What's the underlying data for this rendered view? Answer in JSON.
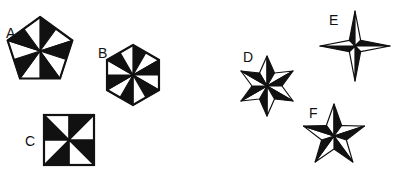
{
  "figure": {
    "background": "#ffffff",
    "ink": "#111111",
    "shapes": [
      {
        "label": "A",
        "type": "pentagon",
        "sectors": 10,
        "pattern": "pinwheel"
      },
      {
        "label": "B",
        "type": "hexagon",
        "sectors": 12,
        "pattern": "pinwheel"
      },
      {
        "label": "C",
        "type": "square",
        "sectors": 8,
        "pattern": "pinwheel"
      },
      {
        "label": "D",
        "type": "six-point-star",
        "pattern": "half-shaded-points"
      },
      {
        "label": "E",
        "type": "four-point-star",
        "pattern": "half-shaded-points"
      },
      {
        "label": "F",
        "type": "five-point-star",
        "pattern": "half-shaded-points"
      }
    ]
  }
}
